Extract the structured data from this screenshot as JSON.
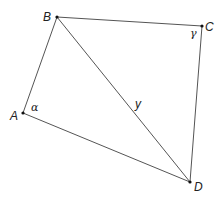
{
  "diagram": {
    "type": "quadrilateral",
    "points": {
      "A": {
        "label": "A",
        "x": 23,
        "y": 113
      },
      "B": {
        "label": "B",
        "x": 57,
        "y": 17
      },
      "C": {
        "label": "C",
        "x": 202,
        "y": 26
      },
      "D": {
        "label": "D",
        "x": 190,
        "y": 182
      }
    },
    "edges": [
      [
        "A",
        "B"
      ],
      [
        "B",
        "C"
      ],
      [
        "C",
        "D"
      ],
      [
        "D",
        "A"
      ],
      [
        "B",
        "D"
      ]
    ],
    "angle_labels": {
      "alpha": "α",
      "gamma": "γ"
    },
    "diagonal_label": "y",
    "colors": {
      "line": "#555555",
      "point": "#111111",
      "text": "#222222"
    }
  }
}
